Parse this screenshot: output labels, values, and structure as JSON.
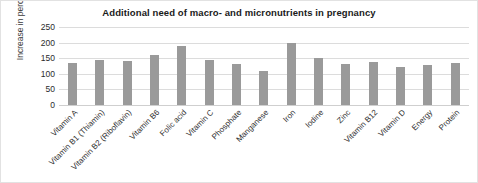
{
  "chart_data": {
    "type": "bar",
    "title": "Additional need of macro- and micronutrients in pregnancy",
    "xlabel": "",
    "ylabel": "Increase in percent",
    "ylim": [
      0,
      250
    ],
    "yticks": [
      0,
      50,
      100,
      150,
      200,
      250
    ],
    "grid": true,
    "legend": "none",
    "bar_color": "#9a9a9a",
    "categories": [
      "Vitamin A",
      "Vitamin B1 (Thiamin)",
      "Vitamin B2 (Riboflavin)",
      "Vitamin B6",
      "Folic acid",
      "Vitamin C",
      "Phosphate",
      "Manganese",
      "Iron",
      "Iodine",
      "Zinc",
      "Vitamin B12",
      "Vitamin D",
      "Energy",
      "Protein"
    ],
    "values": [
      135,
      143,
      140,
      160,
      188,
      145,
      130,
      110,
      200,
      150,
      130,
      138,
      122,
      128,
      135
    ]
  }
}
